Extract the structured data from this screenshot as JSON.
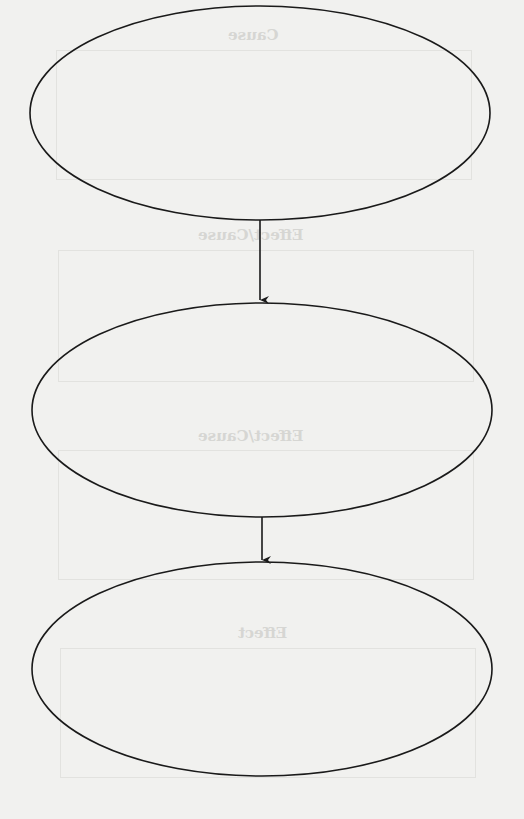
{
  "diagram": {
    "type": "cause-effect-flow",
    "nodes": [
      {
        "id": "node-1",
        "text": "",
        "cx": 260,
        "cy": 113,
        "rx": 230,
        "ry": 107
      },
      {
        "id": "node-2",
        "text": "",
        "cx": 262,
        "cy": 410,
        "rx": 230,
        "ry": 107
      },
      {
        "id": "node-3",
        "text": "",
        "cx": 262,
        "cy": 669,
        "rx": 230,
        "ry": 107
      }
    ],
    "edges": [
      {
        "from": "node-1",
        "to": "node-2",
        "x": 260,
        "y1": 220,
        "y2": 300
      },
      {
        "from": "node-2",
        "to": "node-3",
        "x": 262,
        "y1": 517,
        "y2": 562
      }
    ],
    "stroke_color": "#1a1a1a",
    "background_color": "#f1f1ef"
  },
  "bleed_through": {
    "labels": [
      "Cause",
      "Effect/Cause",
      "Effect/Cause",
      "Effect"
    ]
  }
}
